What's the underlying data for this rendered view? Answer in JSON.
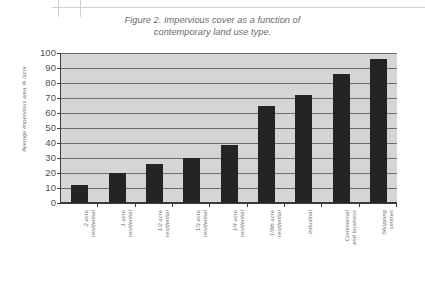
{
  "document": {
    "background_color": "#ffffff",
    "scan_artifact_color": "#cfcfcf"
  },
  "caption": {
    "line1": "Figure 2. Impervious cover as a function of",
    "line2": "contemporary land use type."
  },
  "chart_data": {
    "type": "bar",
    "title": "Figure 2. Impervious cover as a function of contemporary land use type.",
    "xlabel": "",
    "ylabel": "Average impervious area % /acre",
    "ylim": [
      0,
      100
    ],
    "ytick_step": 10,
    "grid": true,
    "legend": "none",
    "plot_background_color": "#d5d5d5",
    "bar_color": "#242424",
    "gridline_color": "#6e6e6e",
    "axis_color": "#3b3b3b",
    "categories": [
      "2 acre residential",
      "1 acre residential",
      "1/2 acre residential",
      "1/3 acre residential",
      "1/4 acre residential",
      "1/8th acre residential",
      "Industrial",
      "Commercial and business",
      "Shopping centres"
    ],
    "category_lines": [
      [
        "2 acre",
        "residential"
      ],
      [
        "1 acre",
        "residential"
      ],
      [
        "1/2 acre",
        "residential"
      ],
      [
        "1/3 acre",
        "residential"
      ],
      [
        "1/4 acre",
        "residential"
      ],
      [
        "1/8th acre",
        "residential"
      ],
      [
        "Industrial"
      ],
      [
        "Commercial",
        "and business"
      ],
      [
        "Shopping",
        "centres"
      ]
    ],
    "values": [
      12,
      20,
      26,
      30,
      39,
      65,
      72,
      86,
      96
    ],
    "yticks": [
      0,
      10,
      20,
      30,
      40,
      50,
      60,
      70,
      80,
      90,
      100
    ],
    "ytick_labels": [
      "0",
      "10",
      "20",
      "30",
      "40",
      "50",
      "60",
      "70",
      "80",
      "90",
      "100"
    ]
  }
}
